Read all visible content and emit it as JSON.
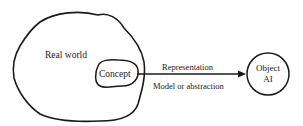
{
  "diagram": {
    "regions": {
      "real_world": {
        "label": "Real world"
      },
      "concept": {
        "label": "Concept"
      }
    },
    "target": {
      "line1": "Object",
      "line2": "AI"
    },
    "arrow": {
      "label_above": "Representation",
      "label_below": "Model or abstraction"
    },
    "colors": {
      "stroke": "#1a1a1a",
      "background": "#ffffff"
    }
  }
}
